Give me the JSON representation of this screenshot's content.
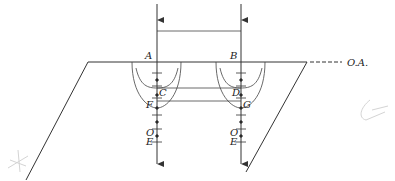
{
  "diagram": {
    "kind": "crystal optics wavefront construction",
    "labels": {
      "A": "A",
      "B": "B",
      "C": "C",
      "D": "D",
      "F": "F",
      "G": "G",
      "O_left": "O",
      "E_left": "E",
      "O_right": "O",
      "E_right": "E",
      "optic_axis": "O.A."
    },
    "colors": {
      "ink": "#333333",
      "background": "#ffffff",
      "faint_marks": "#d4d4d4"
    }
  }
}
